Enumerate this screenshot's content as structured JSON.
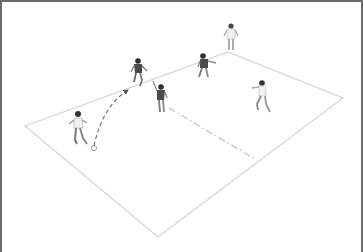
{
  "diagram": {
    "type": "soccer-drill-illustration",
    "pitch": {
      "corners": {
        "left": [
          23,
          124
        ],
        "top": [
          226,
          50
        ],
        "right": [
          341,
          96
        ],
        "bottom": [
          156,
          235
        ]
      },
      "line_color": "#d4d4d4"
    },
    "halfway_line": {
      "from": [
        167,
        106
      ],
      "to": [
        253,
        157
      ],
      "style": "dash-dot",
      "color": "#b8b8b8"
    },
    "ball_path": {
      "from": [
        92,
        146
      ],
      "to": [
        126,
        88
      ],
      "style": "dashed",
      "arrow": true,
      "color": "#6a6a6a"
    },
    "ball": {
      "position": [
        92,
        146
      ]
    },
    "players": [
      {
        "id": "kicker",
        "team": "light",
        "x": 76,
        "y": 132,
        "pose": "kicking"
      },
      {
        "id": "dark-1",
        "team": "dark",
        "x": 136,
        "y": 72,
        "pose": "running"
      },
      {
        "id": "dark-2",
        "team": "dark",
        "x": 158,
        "y": 98,
        "pose": "arm-raised"
      },
      {
        "id": "dark-3",
        "team": "dark",
        "x": 203,
        "y": 66,
        "pose": "running"
      },
      {
        "id": "light-top",
        "team": "light",
        "x": 229,
        "y": 36,
        "pose": "standing"
      },
      {
        "id": "light-right",
        "team": "light",
        "x": 260,
        "y": 96,
        "pose": "running"
      }
    ],
    "colors": {
      "frame_border": "#6a6a6a",
      "light_shirt": "#f2f2f2",
      "dark_shirt": "#4a4a4a",
      "skin": "#8a8a8a",
      "hair": "#333333"
    }
  }
}
